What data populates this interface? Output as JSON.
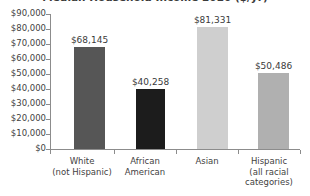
{
  "chart_data": {
    "type": "bar",
    "title": "Median Household Income 2020 ($/yr)",
    "xlabel": "",
    "ylabel": "",
    "ylim": [
      0,
      90000
    ],
    "ytick_step": 10000,
    "grid": false,
    "legend": "none",
    "categories": [
      "White\n(not Hispanic)",
      "African\nAmerican",
      "Asian",
      "Hispanic\n(all racial\ncategories)"
    ],
    "category_lines": [
      [
        "White",
        "(not Hispanic)"
      ],
      [
        "African",
        "American"
      ],
      [
        "Asian"
      ],
      [
        "Hispanic",
        "(all racial",
        "categories)"
      ]
    ],
    "values": [
      68145,
      40258,
      81331,
      50486
    ],
    "value_labels": [
      "$68,145",
      "$40,258",
      "$81,331",
      "$50,486"
    ],
    "bar_colors": [
      "#565656",
      "#1c1c1c",
      "#cfcfcf",
      "#b0b0b0"
    ],
    "ytick_labels": [
      "$90,000",
      "$80,000",
      "$70,000",
      "$60,000",
      "$50,000",
      "$40,000",
      "$30,000",
      "$20,000",
      "$10,000",
      "$0"
    ],
    "ytick_values": [
      90000,
      80000,
      70000,
      60000,
      50000,
      40000,
      30000,
      20000,
      10000,
      0
    ],
    "axis_color": "#8c8c8c",
    "text_color": "#3f3f3f"
  }
}
